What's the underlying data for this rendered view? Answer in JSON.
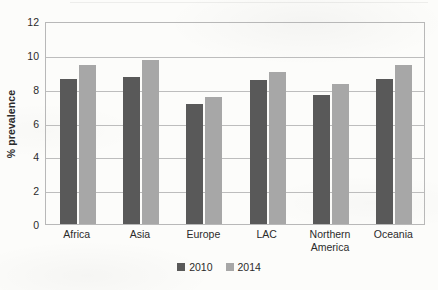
{
  "chart_data": {
    "type": "bar",
    "title": "",
    "xlabel": "",
    "ylabel": "% prevalence",
    "ylim": [
      0,
      12
    ],
    "yticks": [
      0,
      2,
      4,
      6,
      8,
      10,
      12
    ],
    "ytick_labels": [
      "0",
      "2",
      "4",
      "6",
      "8",
      "10",
      "12"
    ],
    "grid": "horizontal",
    "legend_position": "bottom",
    "categories": [
      "Africa",
      "Asia",
      "Europe",
      "LAC",
      "Northern America",
      "Oceania"
    ],
    "series": [
      {
        "name": "2010",
        "color": "#595959",
        "values": [
          8.6,
          8.7,
          7.1,
          8.5,
          7.6,
          8.6
        ]
      },
      {
        "name": "2014",
        "color": "#a7a7a7",
        "values": [
          9.4,
          9.7,
          7.5,
          9.0,
          8.3,
          9.4
        ]
      }
    ]
  },
  "legend": {
    "items": [
      {
        "label": "2010",
        "color": "#595959"
      },
      {
        "label": "2014",
        "color": "#a7a7a7"
      }
    ]
  },
  "axes": {
    "y_title": "% prevalence"
  }
}
